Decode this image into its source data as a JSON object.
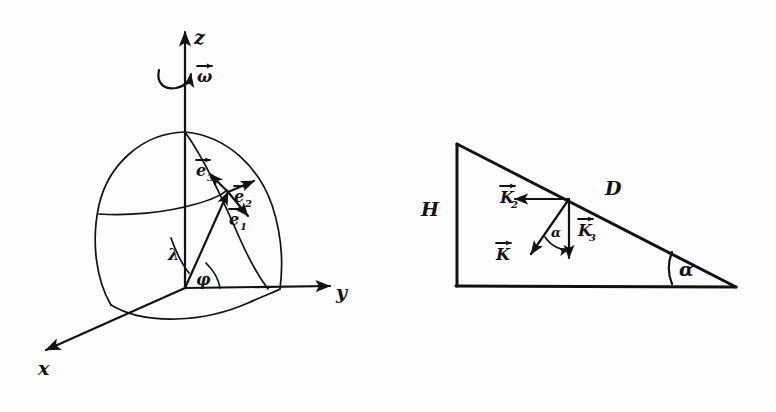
{
  "figure": {
    "background_color": "#fdfdfd",
    "ink_color": "#111111",
    "panels": [
      {
        "id": "left-panel",
        "name": "spherical-coordinate-frame",
        "description": "Rotating sphere octant with z axis, x axis, y axis, angular velocity omega, latitude lambda, longitude phi, and local orthonormal triad e1, e2, e3"
      },
      {
        "id": "right-panel",
        "name": "inclined-wedge-vectors",
        "description": "Right triangle wedge of height H and hypotenuse D with base angle alpha, carrying vectors K2, K3 and resultant K"
      }
    ]
  },
  "left_panel": {
    "axes": [
      {
        "key": "z",
        "label": "z",
        "direction": "up"
      },
      {
        "key": "y",
        "label": "y",
        "direction": "right"
      },
      {
        "key": "x",
        "label": "x",
        "direction": "down-left"
      }
    ],
    "rotation": {
      "label": "ω",
      "vector_label": "ω",
      "has_vector_arrow": true,
      "description": "angular velocity about the z axis"
    },
    "angles": [
      {
        "key": "lambda",
        "label": "λ",
        "description": "latitude angle measured from equatorial plane up to the radius"
      },
      {
        "key": "phi",
        "label": "φ",
        "description": "azimuthal angle measured in the equatorial plane from x toward y"
      }
    ],
    "unit_vectors": [
      {
        "key": "e1",
        "base": "e",
        "subscript": "1",
        "label": "e",
        "direction": "down-right",
        "has_vector_arrow": true
      },
      {
        "key": "e2",
        "base": "e",
        "subscript": "2",
        "label": "e",
        "direction": "up-right-along-parallel",
        "has_vector_arrow": true
      },
      {
        "key": "e3",
        "base": "e",
        "subscript": "3",
        "label": "e",
        "direction": "up-left-radial",
        "has_vector_arrow": true
      }
    ]
  },
  "right_panel": {
    "dimensions": [
      {
        "key": "H",
        "label": "H",
        "description": "vertical height of the wedge (left side)"
      },
      {
        "key": "D",
        "label": "D",
        "description": "inclined hypotenuse of the wedge"
      }
    ],
    "angles": [
      {
        "key": "alpha_base",
        "label": "α",
        "description": "base angle of the wedge at the lower-right corner"
      },
      {
        "key": "alpha_vec",
        "label": "α",
        "description": "angle between vector K and vector K3"
      }
    ],
    "vectors": [
      {
        "key": "K2",
        "base": "K",
        "subscript": "2",
        "label": "K",
        "direction": "left (horizontal)",
        "has_vector_arrow": true
      },
      {
        "key": "K3",
        "base": "K",
        "subscript": "3",
        "label": "K",
        "direction": "down (vertical)",
        "has_vector_arrow": true
      },
      {
        "key": "K",
        "base": "K",
        "subscript": "",
        "label": "K",
        "direction": "down-left (resultant)",
        "has_vector_arrow": true
      }
    ]
  }
}
